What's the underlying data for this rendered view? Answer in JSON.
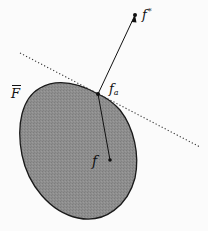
{
  "diagram": {
    "labels": {
      "f_star": "f",
      "f_star_sup": "*",
      "f_a": "f",
      "f_a_sub": "a",
      "f": "f",
      "F_bar": "F"
    },
    "colors": {
      "region_fill": "#8c8c8c",
      "outline": "#1a1a1a",
      "background": "#fbfbfb",
      "dotted_line": "#333333"
    },
    "elements": [
      {
        "type": "region",
        "label": "F̄ (closed convex-ish set)"
      },
      {
        "type": "point",
        "label": "f*",
        "position": "outside set, upper right"
      },
      {
        "type": "point",
        "label": "f_a",
        "position": "on boundary, tangent point"
      },
      {
        "type": "point",
        "label": "f",
        "position": "inside set"
      },
      {
        "type": "line",
        "style": "dotted",
        "label": "tangent / supporting line at f_a"
      },
      {
        "type": "segment",
        "from": "f",
        "to": "f_a"
      },
      {
        "type": "segment",
        "from": "f_a",
        "to": "f*"
      }
    ]
  }
}
